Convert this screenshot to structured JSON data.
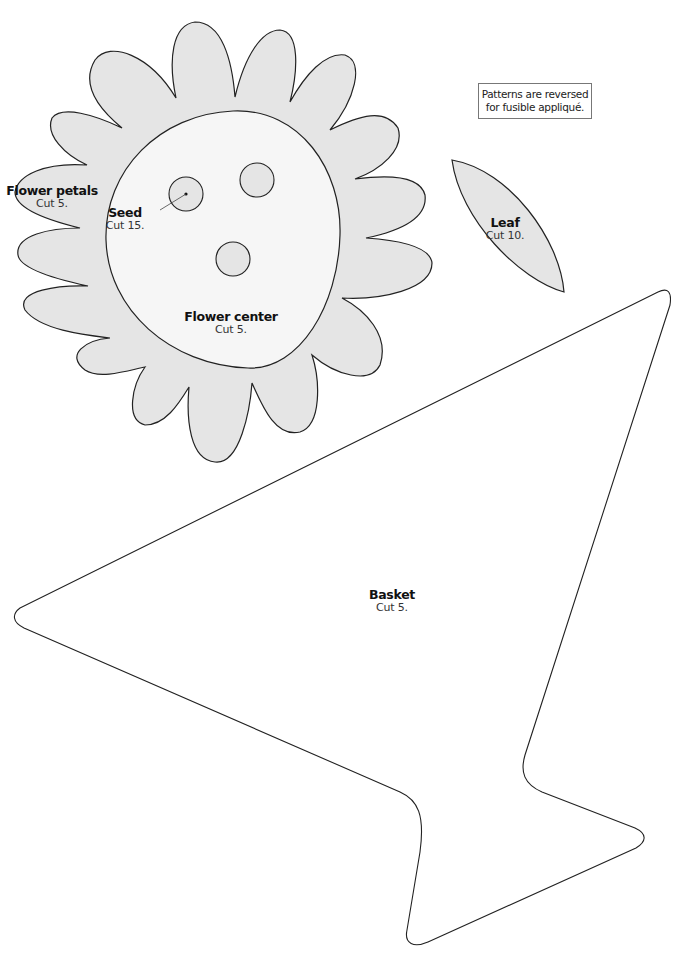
{
  "page": {
    "background": "#ffffff",
    "fill_color": "#e5e5e5",
    "outline_color": "#222222"
  },
  "note": {
    "line1": "Patterns are reversed",
    "line2": "for fusible appliqué."
  },
  "patterns": {
    "flower_petals": {
      "title": "Flower petals",
      "instruction": "Cut 5."
    },
    "seed": {
      "title": "Seed",
      "instruction": "Cut 15."
    },
    "flower_center": {
      "title": "Flower center",
      "instruction": "Cut 5."
    },
    "leaf": {
      "title": "Leaf",
      "instruction": "Cut 10."
    },
    "basket": {
      "title": "Basket",
      "instruction": "Cut 5."
    }
  }
}
